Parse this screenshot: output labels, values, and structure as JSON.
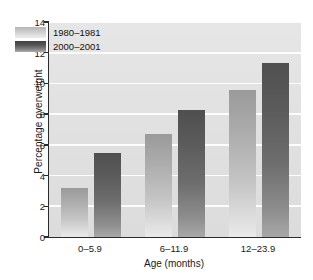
{
  "chart_data": {
    "type": "bar",
    "title": "",
    "xlabel": "Age (months)",
    "ylabel": "Percentage overweight",
    "categories": [
      "0–5.9",
      "6–11.9",
      "12–23.9"
    ],
    "series": [
      {
        "name": "1980–1981",
        "values": [
          3.2,
          6.7,
          9.6
        ],
        "color": "#c4c4c4"
      },
      {
        "name": "2000–2001",
        "values": [
          5.5,
          8.3,
          11.3
        ],
        "color": "#6e6e6e"
      }
    ],
    "ylim": [
      0,
      14
    ],
    "yticks": [
      0,
      2,
      4,
      6,
      8,
      10,
      12,
      14
    ],
    "ytick_labels": [
      "0",
      "2",
      "4",
      "6",
      "8",
      "10",
      "12",
      "14"
    ],
    "grid": "horizontal",
    "grid_color": "#ffffff",
    "plot_background": "#e2e2e2",
    "legend_position": "top-left"
  },
  "axes": {
    "y_title": "Percentage overweight",
    "x_title": "Age (months)"
  },
  "legend": {
    "entries": [
      {
        "label": "1980–1981",
        "swatch": "light-gradient-swatch"
      },
      {
        "label": "2000–2001",
        "swatch": "dark-gradient-swatch"
      }
    ]
  }
}
